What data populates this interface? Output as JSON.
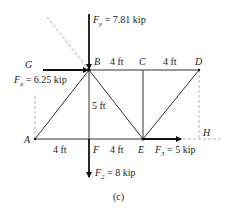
{
  "figure": {
    "caption": "(c)",
    "nodes": {
      "A": "A",
      "B": "B",
      "C": "C",
      "D": "D",
      "E": "E",
      "F": "F",
      "G": "G",
      "H": "H"
    },
    "dimensions": {
      "bc": "4 ft",
      "cd": "4 ft",
      "af": "4 ft",
      "fe": "4 ft",
      "height": "5 ft"
    },
    "forces": {
      "fy": {
        "symbol": "F",
        "sub": "y",
        "text": " = 7.81 kip"
      },
      "fx": {
        "symbol": "F",
        "sub": "x",
        "text": " = 6.25 kip"
      },
      "f2": {
        "symbol": "F",
        "sub": "2",
        "text": " = 8 kip"
      },
      "f3": {
        "symbol": "F",
        "sub": "3",
        "text": " = 5 kip"
      }
    },
    "colors": {
      "member": "#333333",
      "force": "#111111",
      "dashed": "#999999"
    }
  }
}
